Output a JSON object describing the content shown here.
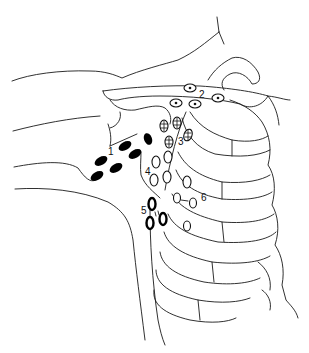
{
  "figure": {
    "type": "anatomical-line-drawing",
    "background": "#ffffff",
    "ink": "#1a1a1a"
  },
  "labels": [
    {
      "id": "1",
      "text": "1",
      "x": 108,
      "y": 155
    },
    {
      "id": "2",
      "text": "2",
      "x": 199,
      "y": 98
    },
    {
      "id": "3",
      "text": "3",
      "x": 178,
      "y": 145
    },
    {
      "id": "4",
      "text": "4",
      "x": 145,
      "y": 175
    },
    {
      "id": "5",
      "text": "5",
      "x": 141,
      "y": 214
    },
    {
      "id": "6",
      "text": "6",
      "x": 201,
      "y": 201
    }
  ],
  "node_groups": [
    {
      "group": "1",
      "style": "solid-black-oval",
      "nodes": [
        {
          "cx": 101,
          "cy": 161,
          "rx": 7,
          "ry": 4,
          "rot": -30
        },
        {
          "cx": 97,
          "cy": 176,
          "rx": 7,
          "ry": 4,
          "rot": -30
        },
        {
          "cx": 116,
          "cy": 168,
          "rx": 7,
          "ry": 4,
          "rot": -30
        },
        {
          "cx": 125,
          "cy": 146,
          "rx": 7,
          "ry": 4,
          "rot": -30
        },
        {
          "cx": 135,
          "cy": 154,
          "rx": 7,
          "ry": 4,
          "rot": -30
        },
        {
          "cx": 148,
          "cy": 139,
          "rx": 4,
          "ry": 6,
          "rot": -20
        }
      ]
    },
    {
      "group": "2",
      "style": "circle-with-center-dot",
      "nodes": [
        {
          "cx": 190,
          "cy": 88,
          "rx": 6,
          "ry": 4
        },
        {
          "cx": 218,
          "cy": 98,
          "rx": 6,
          "ry": 4
        },
        {
          "cx": 176,
          "cy": 103,
          "rx": 6,
          "ry": 4
        },
        {
          "cx": 195,
          "cy": 104,
          "rx": 6,
          "ry": 4
        }
      ]
    },
    {
      "group": "3",
      "style": "crosshatched-oval",
      "nodes": [
        {
          "cx": 164,
          "cy": 126,
          "rx": 4,
          "ry": 6
        },
        {
          "cx": 177,
          "cy": 123,
          "rx": 4,
          "ry": 6
        },
        {
          "cx": 169,
          "cy": 142,
          "rx": 4,
          "ry": 6
        },
        {
          "cx": 188,
          "cy": 135,
          "rx": 4,
          "ry": 6
        }
      ]
    },
    {
      "group": "4",
      "style": "open-oval",
      "nodes": [
        {
          "cx": 156,
          "cy": 162,
          "rx": 4,
          "ry": 6
        },
        {
          "cx": 154,
          "cy": 180,
          "rx": 4,
          "ry": 6
        },
        {
          "cx": 167,
          "cy": 177,
          "rx": 4,
          "ry": 6
        },
        {
          "cx": 168,
          "cy": 157,
          "rx": 4,
          "ry": 6
        },
        {
          "cx": 187,
          "cy": 182,
          "rx": 4,
          "ry": 6
        }
      ]
    },
    {
      "group": "5",
      "style": "bold-open-oval",
      "nodes": [
        {
          "cx": 152,
          "cy": 204,
          "rx": 3.5,
          "ry": 6
        },
        {
          "cx": 150,
          "cy": 223,
          "rx": 3.5,
          "ry": 6
        },
        {
          "cx": 163,
          "cy": 219,
          "rx": 3.5,
          "ry": 6
        }
      ]
    },
    {
      "group": "6",
      "style": "open-oval",
      "nodes": [
        {
          "cx": 177,
          "cy": 198,
          "rx": 3.5,
          "ry": 5
        },
        {
          "cx": 193,
          "cy": 203,
          "rx": 3.5,
          "ry": 5
        },
        {
          "cx": 187,
          "cy": 226,
          "rx": 3.5,
          "ry": 5
        }
      ]
    }
  ]
}
